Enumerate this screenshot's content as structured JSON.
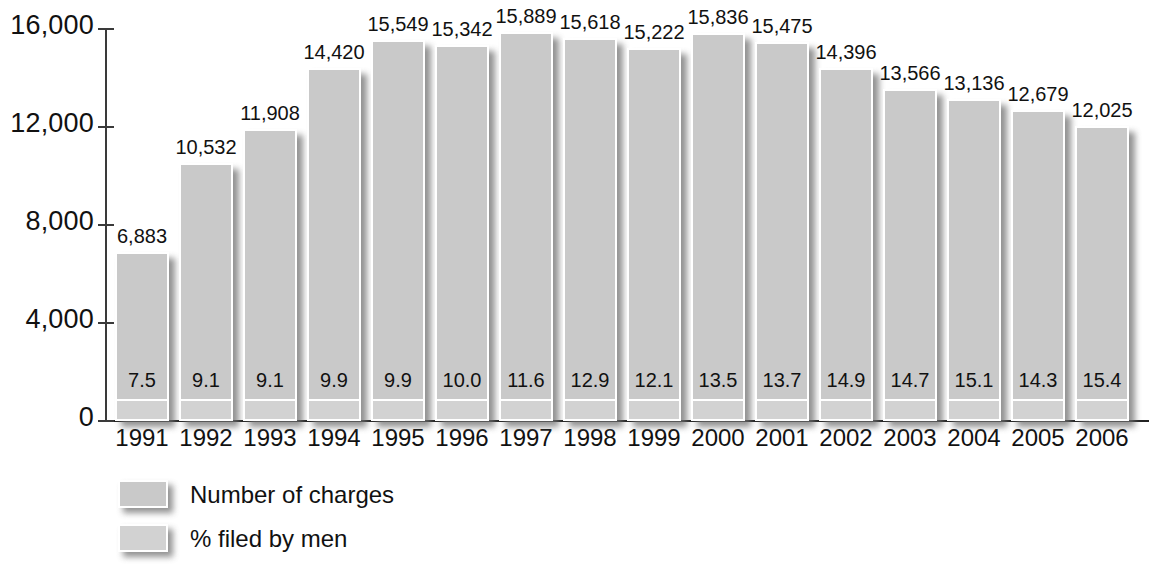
{
  "chart_data": {
    "type": "bar",
    "title": "",
    "subtitle": "",
    "xlabel": "",
    "ylabel": "",
    "ylim": [
      0,
      16000
    ],
    "yticks": [
      0,
      4000,
      8000,
      12000,
      16000
    ],
    "ytick_labels": [
      "0",
      "4,000",
      "8,000",
      "12,000",
      "16,000"
    ],
    "grid": false,
    "legend_position": "bottom-left",
    "categories": [
      "1991",
      "1992",
      "1993",
      "1994",
      "1995",
      "1996",
      "1997",
      "1998",
      "1999",
      "2000",
      "2001",
      "2002",
      "2003",
      "2004",
      "2005",
      "2006"
    ],
    "series": [
      {
        "name": "Number of charges",
        "color": "#c9c9c9",
        "values": [
          6883,
          10532,
          11908,
          14420,
          15549,
          15342,
          15889,
          15618,
          15222,
          15836,
          15475,
          14396,
          13566,
          13136,
          12679,
          12025
        ],
        "value_labels": [
          "6,883",
          "10,532",
          "11,908",
          "14,420",
          "15,549",
          "15,342",
          "15,889",
          "15,618",
          "15,222",
          "15,836",
          "15,475",
          "14,396",
          "13,566",
          "13,136",
          "12,679",
          "12,025"
        ]
      },
      {
        "name": "% filed by men",
        "color": "#d2d2d2",
        "values": [
          7.5,
          9.1,
          9.1,
          9.9,
          9.9,
          10.0,
          11.6,
          12.9,
          12.1,
          13.5,
          13.7,
          14.9,
          14.7,
          15.1,
          14.3,
          15.4
        ],
        "value_labels": [
          "7.5",
          "9.1",
          "9.1",
          "9.9",
          "9.9",
          "10.0",
          "11.6",
          "12.9",
          "12.1",
          "13.5",
          "13.7",
          "14.9",
          "14.7",
          "15.1",
          "14.3",
          "15.4"
        ]
      }
    ]
  },
  "legend": {
    "items": [
      {
        "label": "Number of charges",
        "key": "charges"
      },
      {
        "label": "% filed by men",
        "key": "men"
      }
    ]
  }
}
